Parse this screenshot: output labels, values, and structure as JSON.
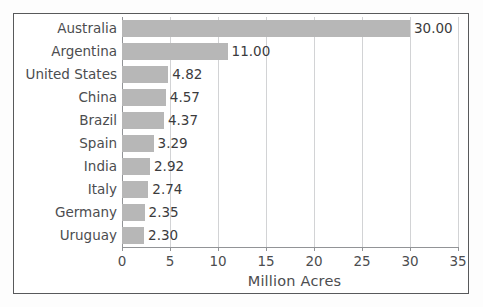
{
  "chart_data": {
    "type": "bar",
    "orientation": "horizontal",
    "title": "",
    "xlabel": "Million Acres",
    "ylabel": "",
    "xlim": [
      0,
      35
    ],
    "xticks": [
      0,
      5,
      10,
      15,
      20,
      25,
      30,
      35
    ],
    "xtick_labels": [
      "0",
      "5",
      "10",
      "15",
      "20",
      "25",
      "30",
      "35"
    ],
    "grid": "vertical",
    "legend": "none",
    "bar_color": "#b7b7b7",
    "categories": [
      "Australia",
      "Argentina",
      "United States",
      "China",
      "Brazil",
      "Spain",
      "India",
      "Italy",
      "Germany",
      "Uruguay"
    ],
    "values": [
      30.0,
      11.0,
      4.82,
      4.57,
      4.37,
      3.29,
      2.92,
      2.74,
      2.35,
      2.3
    ],
    "value_labels": [
      "30.00",
      "11.00",
      "4.82",
      "4.57",
      "4.37",
      "3.29",
      "2.92",
      "2.74",
      "2.35",
      "2.30"
    ]
  }
}
